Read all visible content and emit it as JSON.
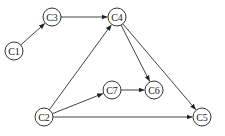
{
  "diagram": {
    "type": "directed-graph",
    "node_radius": 9,
    "colors": {
      "stroke": "#333333",
      "fill": "#ffffff",
      "edge": "#444444",
      "text": "#222222"
    },
    "nodes": [
      {
        "id": "C1",
        "label": "C1",
        "x": 14,
        "y": 51
      },
      {
        "id": "C3",
        "label": "C3",
        "x": 52,
        "y": 17
      },
      {
        "id": "C4",
        "label": "C4",
        "x": 117,
        "y": 17
      },
      {
        "id": "C7",
        "label": "C7",
        "x": 112,
        "y": 90
      },
      {
        "id": "C6",
        "label": "C6",
        "x": 154,
        "y": 90
      },
      {
        "id": "C2",
        "label": "C2",
        "x": 44,
        "y": 117
      },
      {
        "id": "C5",
        "label": "C5",
        "x": 202,
        "y": 117
      }
    ],
    "edges": [
      {
        "from": "C1",
        "to": "C3"
      },
      {
        "from": "C3",
        "to": "C4"
      },
      {
        "from": "C2",
        "to": "C4"
      },
      {
        "from": "C2",
        "to": "C7"
      },
      {
        "from": "C7",
        "to": "C6"
      },
      {
        "from": "C4",
        "to": "C6"
      },
      {
        "from": "C4",
        "to": "C5"
      },
      {
        "from": "C2",
        "to": "C5"
      }
    ]
  }
}
